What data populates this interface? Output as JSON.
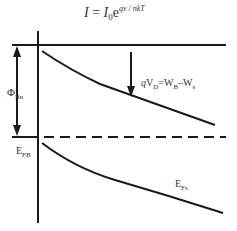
{
  "equation": {
    "lhs": "I",
    "eq": " = ",
    "base": "I",
    "base_sub": "0",
    "exp_base": "e",
    "exponent": "qv / nkT"
  },
  "labels": {
    "barrier": {
      "symbol": "Φ",
      "sub": "Bn"
    },
    "fermi_metal": {
      "symbol": "E",
      "sub": "FB"
    },
    "voltage": {
      "prefix": "qV",
      "sub_d": "D",
      "mid": "=W",
      "sub_b": "B",
      "dash": "–W",
      "sub_s": "s"
    },
    "fermi_semi": {
      "symbol": "E",
      "sub": "Fs"
    }
  },
  "colors": {
    "line": "#1a1a1a",
    "background": "#ffffff"
  }
}
